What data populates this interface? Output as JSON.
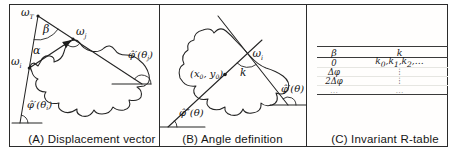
{
  "figure": {
    "panels": {
      "a": {
        "caption": "(A) Displacement vector",
        "labels": {
          "omega_t": [
            {
              "t": "ω"
            },
            {
              "s": "T"
            }
          ],
          "beta": [
            {
              "t": "β"
            }
          ],
          "alpha": [
            {
              "t": "α"
            }
          ],
          "omega_i": [
            {
              "t": "ω"
            },
            {
              "s": "i"
            }
          ],
          "omega_j": [
            {
              "t": "ω"
            },
            {
              "s": "j"
            }
          ],
          "phi_theta_i": [
            {
              "t": "φ̂′(θ"
            },
            {
              "s": "i"
            },
            {
              "t": ")"
            }
          ],
          "phi_theta_j": [
            {
              "t": "φ̂′(θ"
            },
            {
              "s": "j"
            },
            {
              "t": ")"
            }
          ]
        }
      },
      "b": {
        "caption": "(B) Angle definition",
        "labels": {
          "center_point": [
            {
              "t": "(x"
            },
            {
              "s": "0"
            },
            {
              "t": ", y"
            },
            {
              "s": "0"
            },
            {
              "t": ")"
            }
          ],
          "omega_i": [
            {
              "t": "ω"
            },
            {
              "s": "i"
            }
          ],
          "k": [
            {
              "t": "k"
            }
          ],
          "phi_prime": [
            {
              "t": "φ̂′(θ)"
            }
          ],
          "phi_double_prime": [
            {
              "t": "φ̂″(θ)"
            }
          ]
        }
      },
      "c": {
        "caption": "(C) Invariant R-table",
        "table": {
          "headers": {
            "col1": [
              {
                "t": "β"
              }
            ],
            "col2": [
              {
                "t": "k"
              }
            ]
          },
          "rows": [
            {
              "c1": [
                {
                  "t": "0"
                }
              ],
              "c2": [
                {
                  "t": "k"
                },
                {
                  "s": "0"
                },
                {
                  "t": ",k"
                },
                {
                  "s": "1"
                },
                {
                  "t": ",k"
                },
                {
                  "s": "2"
                },
                {
                  "t": ",…"
                }
              ]
            },
            {
              "c1": [
                {
                  "t": "Δφ"
                }
              ],
              "c2": [
                {
                  "t": "⋮"
                }
              ]
            },
            {
              "c1": [
                {
                  "t": "2Δφ"
                }
              ],
              "c2": [
                {
                  "t": "⋮"
                }
              ]
            },
            {
              "c1": [
                {
                  "t": "…"
                }
              ],
              "c2": [
                {
                  "t": "…"
                }
              ]
            }
          ]
        }
      }
    }
  }
}
